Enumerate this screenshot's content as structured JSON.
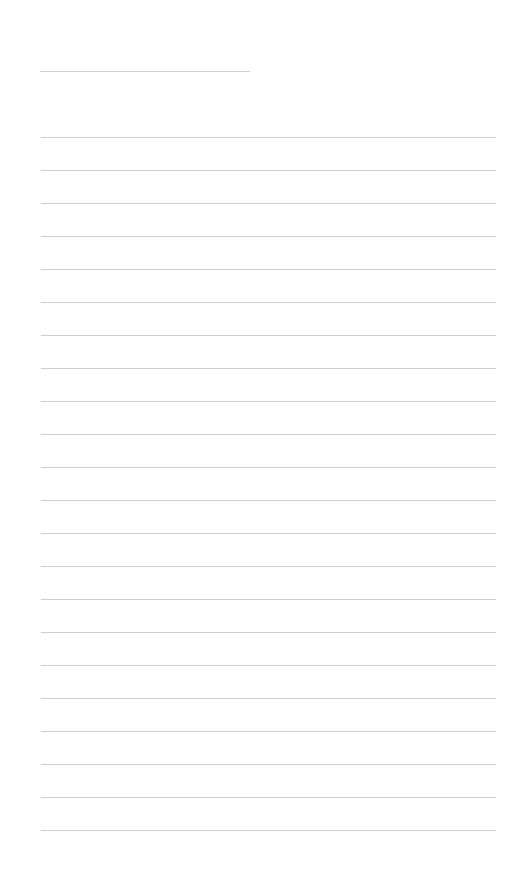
{
  "document": {
    "type": "lined-writing-page",
    "title_line": {
      "filled_text": ""
    },
    "ruled_lines": {
      "count": 22,
      "first_y": 137,
      "spacing": 33,
      "texts": [
        "",
        "",
        "",
        "",
        "",
        "",
        "",
        "",
        "",
        "",
        "",
        "",
        "",
        "",
        "",
        "",
        "",
        "",
        "",
        "",
        "",
        ""
      ]
    },
    "colors": {
      "paper": "#ffffff",
      "rule": "#cdcdcd"
    }
  }
}
